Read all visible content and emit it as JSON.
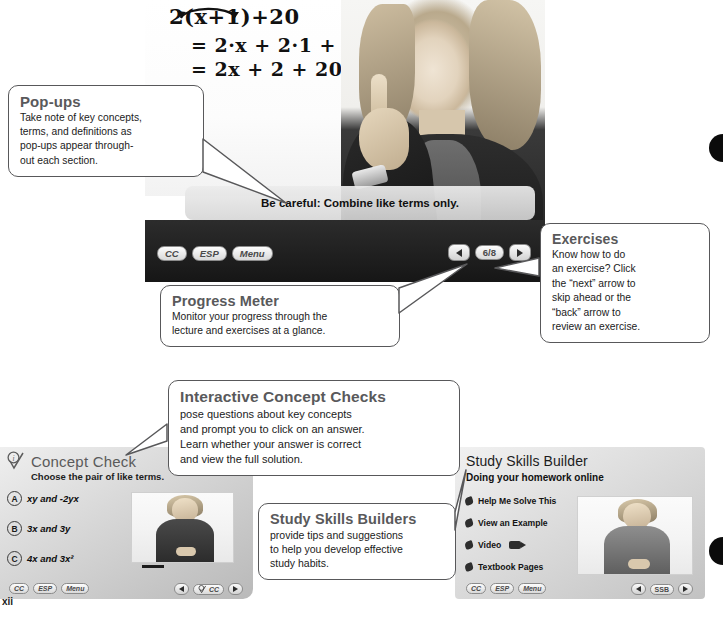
{
  "folio": "xii",
  "video_panel": {
    "equation_lines": [
      "2(x+1)+20",
      "= 2·x + 2·1 + 2",
      "= 2x + 2 + 20"
    ],
    "popup_text": "Be careful: Combine like terms only.",
    "controls": {
      "cc_label": "CC",
      "esp_label": "ESP",
      "menu_label": "Menu",
      "back_arrow": "back-arrow",
      "next_arrow": "next-arrow",
      "progress": "6/8"
    }
  },
  "concept_check": {
    "title": "Concept Check",
    "prompt": "Choose the pair of like terms.",
    "options": [
      {
        "letter": "A",
        "text": "xy and -2yx"
      },
      {
        "letter": "B",
        "text": "3x and 3y"
      },
      {
        "letter": "C",
        "text": "4x and 3x²"
      }
    ],
    "controls": {
      "cc_label": "CC",
      "esp_label": "ESP",
      "menu_label": "Menu",
      "nav_label": "CC"
    }
  },
  "study_skills_builder": {
    "title": "Study Skills Builder",
    "subtitle": "Doing your homework online",
    "items": [
      "Help Me Solve This",
      "View an Example",
      "Video",
      "Textbook Pages"
    ],
    "controls": {
      "cc_label": "CC",
      "esp_label": "ESP",
      "menu_label": "Menu",
      "nav_label": "SSB"
    }
  },
  "callouts": {
    "popups": {
      "title": "Pop-ups",
      "lines": [
        "Take note of key concepts,",
        "terms, and definitions as",
        "pop-ups appear through-",
        "out each section."
      ]
    },
    "exercises": {
      "title": "Exercises",
      "lines": [
        "Know how to do",
        "an exercise? Click",
        "the “next” arrow to",
        "skip ahead or the",
        "“back” arrow to",
        "review an exercise."
      ]
    },
    "progress_meter": {
      "title": "Progress Meter",
      "lines": [
        "Monitor your progress through the",
        "lecture and exercises at a glance."
      ]
    },
    "interactive_concept_checks": {
      "title": "Interactive Concept Checks",
      "lines": [
        "pose questions about key concepts",
        "and prompt you to click on an answer.",
        "Learn whether your answer is correct",
        "and view the full solution."
      ]
    },
    "study_skills_builders": {
      "title": "Study Skills Builders",
      "lines": [
        "provide tips and suggestions",
        "to help you develop effective",
        "study habits."
      ]
    }
  },
  "colors": {
    "callout_border": "#58585a",
    "callout_title": "#59595b",
    "body_text": "#1b1b1b",
    "panel_dark": "#1d1d1d"
  }
}
